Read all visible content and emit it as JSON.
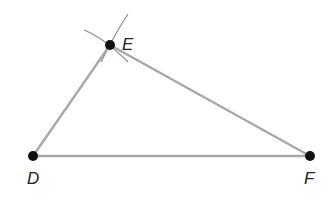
{
  "diagram": {
    "type": "triangle-construction",
    "points": [
      {
        "id": "D",
        "label": "D",
        "x": 33,
        "y": 156
      },
      {
        "id": "E",
        "label": "E",
        "x": 110,
        "y": 45
      },
      {
        "id": "F",
        "label": "F",
        "x": 310,
        "y": 156
      }
    ],
    "segments": [
      {
        "from": "D",
        "to": "E"
      },
      {
        "from": "E",
        "to": "F"
      },
      {
        "from": "D",
        "to": "F"
      }
    ],
    "construction_arcs": 2,
    "colors": {
      "segment": "#a8a8a8",
      "arc": "#8c8c8c",
      "point": "#111111",
      "label": "#222222"
    }
  }
}
